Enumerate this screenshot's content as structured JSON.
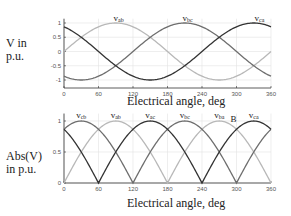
{
  "chart_data": [
    {
      "type": "line",
      "title": "",
      "xlabel": "Electrical angle, deg",
      "ylabel": "V in p.u.",
      "ylabel_lines": [
        "V in",
        "p.u."
      ],
      "xlim": [
        0,
        360
      ],
      "ylim": [
        -1.15,
        1.15
      ],
      "xticks": [
        0,
        60,
        120,
        180,
        240,
        300,
        360
      ],
      "yticks": [
        1,
        0.5,
        0,
        -0.5,
        -1
      ],
      "ytick_labels": [
        "1",
        "0.5",
        "0",
        "-0.5",
        "-1"
      ],
      "grid": true,
      "series": [
        {
          "name": "Vab",
          "formula": "sin(theta)",
          "color": "#b8b8b8",
          "label_x": 95,
          "label_y": 1.08
        },
        {
          "name": "Vbc",
          "formula": "sin(theta-120)",
          "color": "#6e6e6e",
          "label_x": 215,
          "label_y": 1.08
        },
        {
          "name": "Vca",
          "formula": "sin(theta+120)",
          "color": "#333333",
          "label_x": 340,
          "label_y": 1.08
        }
      ],
      "x": [
        0,
        30,
        60,
        90,
        120,
        150,
        180,
        210,
        240,
        270,
        300,
        330,
        360
      ],
      "values": {
        "Vab": [
          0,
          0.5,
          0.87,
          1,
          0.87,
          0.5,
          0,
          -0.5,
          -0.87,
          -1,
          -0.87,
          -0.5,
          0
        ],
        "Vbc": [
          -0.87,
          -1,
          -0.87,
          -0.5,
          0,
          0.5,
          0.87,
          1,
          0.87,
          0.5,
          0,
          -0.5,
          -0.87
        ],
        "Vca": [
          0.87,
          0.5,
          0,
          -0.5,
          -0.87,
          -1,
          -0.87,
          -0.5,
          0,
          0.5,
          0.87,
          1,
          0.87
        ]
      }
    },
    {
      "type": "line",
      "title": "",
      "xlabel": "Electrical angle, deg",
      "ylabel": "Abs(V) in p.u.",
      "ylabel_lines": [
        "Abs(V)",
        "in p.u."
      ],
      "xlim": [
        0,
        360
      ],
      "ylim": [
        0,
        1.12
      ],
      "xticks": [
        0,
        60,
        120,
        180,
        240,
        300,
        360
      ],
      "yticks": [
        1,
        0.5,
        0
      ],
      "ytick_labels": [
        "1",
        "0.5",
        "0"
      ],
      "grid": true,
      "series": [
        {
          "name": "|Vab|",
          "formula": "abs(sin(theta))",
          "color": "#b8b8b8"
        },
        {
          "name": "|Vbc|",
          "formula": "abs(sin(theta-120))",
          "color": "#6e6e6e"
        },
        {
          "name": "|Vca|",
          "formula": "abs(sin(theta+120))",
          "color": "#333333"
        }
      ],
      "curve_labels": [
        {
          "text": "v",
          "sub": "cb",
          "x": 30
        },
        {
          "text": "v",
          "sub": "ab",
          "x": 90
        },
        {
          "text": "v",
          "sub": "ac",
          "x": 150
        },
        {
          "text": "v",
          "sub": "bc",
          "x": 210
        },
        {
          "text": "v",
          "sub": "ba",
          "x": 270
        },
        {
          "text": "v",
          "sub": "ca",
          "x": 330
        }
      ],
      "annotations": [
        {
          "text": "B",
          "x": 300,
          "y": 1.0
        }
      ],
      "zero_crossings_deg": [
        0,
        60,
        120,
        180,
        240,
        300,
        360
      ]
    }
  ],
  "top": {
    "ylabel_line1": "V in",
    "ylabel_line2": "p.u.",
    "xlabel": "Electrical angle, deg",
    "labels": {
      "vab_sub": "ab",
      "vbc_sub": "bc",
      "vca_sub": "ca",
      "v": "v"
    }
  },
  "bottom": {
    "ylabel_line1": "Abs(V)",
    "ylabel_line2": "in p.u.",
    "xlabel": "Electrical angle, deg",
    "annotation_b": "B"
  }
}
